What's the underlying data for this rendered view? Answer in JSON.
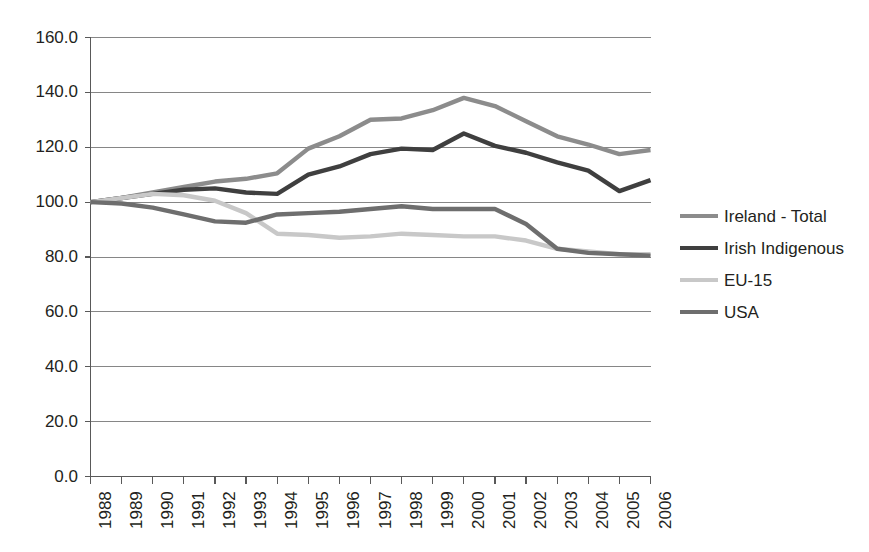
{
  "chart_data": {
    "type": "line",
    "title": "",
    "xlabel": "",
    "ylabel": "",
    "grid": true,
    "legend_position": "right",
    "ylim": [
      0.0,
      160.0
    ],
    "ytick_labels": [
      "0.0",
      "20.0",
      "40.0",
      "60.0",
      "80.0",
      "100.0",
      "120.0",
      "140.0",
      "160.0"
    ],
    "ytick_values": [
      0.0,
      20.0,
      40.0,
      60.0,
      80.0,
      100.0,
      120.0,
      140.0,
      160.0
    ],
    "categories": [
      "1988",
      "1989",
      "1990",
      "1991",
      "1992",
      "1993",
      "1994",
      "1995",
      "1996",
      "1997",
      "1998",
      "1999",
      "2000",
      "2001",
      "2002",
      "2003",
      "2004",
      "2005",
      "2006"
    ],
    "series": [
      {
        "name": "Ireland - Total",
        "color": "#8c8c8c",
        "values": [
          100.0,
          101.5,
          103.5,
          105.5,
          107.5,
          108.5,
          110.5,
          119.5,
          124.0,
          130.0,
          130.5,
          133.5,
          138.0,
          135.0,
          129.5,
          124.0,
          121.0,
          117.5,
          119.0
        ]
      },
      {
        "name": "Irish Indigenous",
        "color": "#3f3f3f",
        "values": [
          100.0,
          101.5,
          103.0,
          104.5,
          105.0,
          103.5,
          103.0,
          110.0,
          113.0,
          117.5,
          119.5,
          119.0,
          125.0,
          120.5,
          118.0,
          114.5,
          111.5,
          104.0,
          108.0
        ]
      },
      {
        "name": "EU-15",
        "color": "#c8c8c8",
        "values": [
          100.0,
          101.5,
          103.0,
          102.5,
          100.5,
          96.0,
          88.5,
          88.0,
          87.0,
          87.5,
          88.5,
          88.0,
          87.5,
          87.5,
          86.0,
          83.0,
          82.0,
          81.0,
          81.0
        ]
      },
      {
        "name": "USA",
        "color": "#6e6e6e",
        "values": [
          100.0,
          99.5,
          98.0,
          95.5,
          93.0,
          92.5,
          95.5,
          96.0,
          96.5,
          97.5,
          98.5,
          97.5,
          97.5,
          97.5,
          92.0,
          83.0,
          81.5,
          81.0,
          80.5
        ]
      }
    ]
  },
  "legend": {
    "items": [
      {
        "label": "Ireland - Total",
        "color": "#8c8c8c"
      },
      {
        "label": "Irish Indigenous",
        "color": "#3f3f3f"
      },
      {
        "label": "EU-15",
        "color": "#c8c8c8"
      },
      {
        "label": "USA",
        "color": "#6e6e6e"
      }
    ]
  },
  "axes": {
    "y_axis_name": "value-axis",
    "x_axis_name": "year-axis"
  }
}
